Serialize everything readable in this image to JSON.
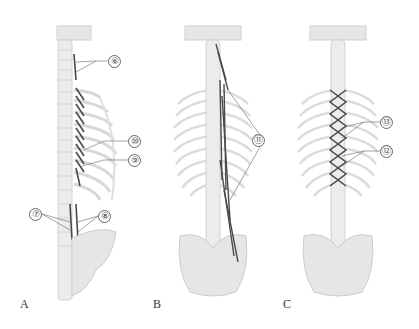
{
  "figure": {
    "colors": {
      "background": "#ffffff",
      "bone_fill": "#e8e8e8",
      "bone_stroke": "#c9c9c9",
      "muscle": "#4a4a4a",
      "leader_line": "#666666"
    },
    "panels": [
      {
        "letter": "A",
        "view": "lateral-posterior",
        "callouts": [
          {
            "label": "⑥",
            "number": 6
          },
          {
            "label": "⑩",
            "number": 10
          },
          {
            "label": "⑨",
            "number": 9
          },
          {
            "label": "⑦",
            "number": 7
          },
          {
            "label": "⑧",
            "number": 8
          }
        ]
      },
      {
        "letter": "B",
        "view": "posterior",
        "callouts": [
          {
            "label": "⑪",
            "number": 11
          }
        ]
      },
      {
        "letter": "C",
        "view": "posterior",
        "callouts": [
          {
            "label": "⑬",
            "number": 13
          },
          {
            "label": "⑫",
            "number": 12
          }
        ]
      }
    ]
  }
}
